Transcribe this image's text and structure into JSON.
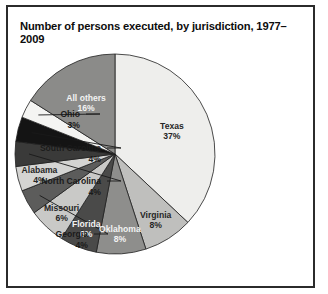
{
  "figure": {
    "title": "Number of persons executed, by jurisdiction, 1977–2009",
    "border_color": "#2b2b2b",
    "background_color": "#ffffff"
  },
  "chart_data": {
    "type": "pie",
    "title": "Number of persons executed, by jurisdiction, 1977–2009",
    "xlabel": "",
    "ylabel": "",
    "units": "percent",
    "start_angle_deg": 0,
    "direction": "clockwise",
    "legend": "none",
    "grid": false,
    "categories": [
      "Texas",
      "Virginia",
      "Oklahoma",
      "Florida",
      "Missouri",
      "Georgia",
      "Alabama",
      "North Carolina",
      "South Carolina",
      "Ohio",
      "All others"
    ],
    "values": [
      37,
      8,
      8,
      6,
      6,
      4,
      4,
      4,
      4,
      3,
      16
    ],
    "slices": [
      {
        "label": "Texas",
        "value": 37,
        "value_text": "37%",
        "color": "#eeeeec",
        "label_placement": "inside",
        "label_tone": "on-light"
      },
      {
        "label": "Virginia",
        "value": 8,
        "value_text": "8%",
        "color": "#bfbfbd",
        "label_placement": "inside",
        "label_tone": "on-light"
      },
      {
        "label": "Oklahoma",
        "value": 8,
        "value_text": "8%",
        "color": "#8e8e8c",
        "label_placement": "inside",
        "label_tone": "on-dark"
      },
      {
        "label": "Florida",
        "value": 6,
        "value_text": "6%",
        "color": "#4a4a49",
        "label_placement": "inside",
        "label_tone": "on-dark"
      },
      {
        "label": "Missouri",
        "value": 6,
        "value_text": "6%",
        "color": "#c9c9c7",
        "label_placement": "inside",
        "label_tone": "on-light"
      },
      {
        "label": "Georgia",
        "value": 4,
        "value_text": "4%",
        "color": "#5c5c5b",
        "label_placement": "outside",
        "label_tone": "on-light"
      },
      {
        "label": "Alabama",
        "value": 4,
        "value_text": "4%",
        "color": "#d4d4d2",
        "label_placement": "inside",
        "label_tone": "on-light"
      },
      {
        "label": "North Carolina",
        "value": 4,
        "value_text": "4%",
        "color": "#3a3a39",
        "label_placement": "outside",
        "label_tone": "on-light"
      },
      {
        "label": "South Carolina",
        "value": 4,
        "value_text": "4%",
        "color": "#141414",
        "label_placement": "outside",
        "label_tone": "on-light"
      },
      {
        "label": "Ohio",
        "value": 3,
        "value_text": "3%",
        "color": "#f4f4f2",
        "label_placement": "outside",
        "label_tone": "on-light"
      },
      {
        "label": "All others",
        "value": 16,
        "value_text": "16%",
        "color": "#8b8b89",
        "label_placement": "inside",
        "label_tone": "on-dark"
      }
    ]
  }
}
